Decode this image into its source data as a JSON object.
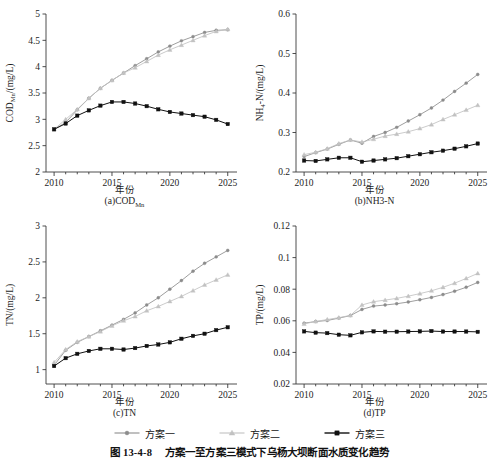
{
  "figure": {
    "caption_number": "图 13-4-8",
    "caption_text": "方案一至方案三模式下乌杨大坝断面水质变化趋势",
    "xaxis_name": "年份"
  },
  "legend": {
    "position": "bottom-center",
    "items": [
      {
        "label": "方案一",
        "marker": "circle",
        "color": "#8c8c8c",
        "line_color": "#8c8c8c"
      },
      {
        "label": "方案二",
        "marker": "triangle",
        "color": "#c2c2c2",
        "line_color": "#c2c2c2"
      },
      {
        "label": "方案三",
        "marker": "square",
        "color": "#111111",
        "line_color": "#111111"
      }
    ]
  },
  "chart_data": [
    {
      "id": "a",
      "type": "line",
      "title": "",
      "panel_caption": "(a)COD",
      "panel_caption_sub": "Mn",
      "ylabel": "COD",
      "ylabel_sub": "Mn",
      "ylabel_unit": "/(mg/L)",
      "xlabel": "年份",
      "x": [
        2010,
        2011,
        2012,
        2013,
        2014,
        2015,
        2016,
        2017,
        2018,
        2019,
        2020,
        2021,
        2022,
        2023,
        2024,
        2025
      ],
      "xlim": [
        2009.3,
        2025.8
      ],
      "ylim": [
        2,
        5
      ],
      "yticks": [
        2,
        2.5,
        3,
        3.5,
        4,
        4.5,
        5
      ],
      "ytick_labels": [
        "2",
        "2.5",
        "3",
        "3.5",
        "4",
        "4.5",
        "5"
      ],
      "xticks": [
        2010,
        2015,
        2020,
        2025
      ],
      "xtick_labels": [
        "2010",
        "2015",
        "2020",
        "2025"
      ],
      "grid": false,
      "series": [
        {
          "name": "方案一",
          "marker": "circle",
          "color": "#8c8c8c",
          "values": [
            2.81,
            2.94,
            3.18,
            3.4,
            3.59,
            3.74,
            3.88,
            4.02,
            4.15,
            4.28,
            4.39,
            4.49,
            4.57,
            4.65,
            4.69,
            4.7
          ]
        },
        {
          "name": "方案二",
          "marker": "triangle",
          "color": "#c2c2c2",
          "values": [
            2.81,
            3.0,
            3.19,
            3.4,
            3.59,
            3.74,
            3.88,
            3.98,
            4.1,
            4.22,
            4.32,
            4.41,
            4.5,
            4.59,
            4.67,
            4.71
          ]
        },
        {
          "name": "方案三",
          "marker": "square",
          "color": "#111111",
          "values": [
            2.81,
            2.92,
            3.07,
            3.17,
            3.26,
            3.33,
            3.33,
            3.3,
            3.25,
            3.19,
            3.14,
            3.11,
            3.08,
            3.05,
            2.99,
            2.91
          ]
        }
      ]
    },
    {
      "id": "b",
      "type": "line",
      "title": "",
      "panel_caption": "(b)NH3-N",
      "panel_caption_sub": "",
      "ylabel": "NH",
      "ylabel_sub": "4",
      "ylabel_unit": "-N/(mg/L)",
      "xlabel": "年份",
      "x": [
        2010,
        2011,
        2012,
        2013,
        2014,
        2015,
        2016,
        2017,
        2018,
        2019,
        2020,
        2021,
        2022,
        2023,
        2024,
        2025
      ],
      "xlim": [
        2009.3,
        2025.8
      ],
      "ylim": [
        0.2,
        0.6
      ],
      "yticks": [
        0.2,
        0.3,
        0.4,
        0.5,
        0.6
      ],
      "ytick_labels": [
        "0.2",
        "0.3",
        "0.4",
        "0.5",
        "0.6"
      ],
      "xticks": [
        2010,
        2015,
        2020,
        2025
      ],
      "xtick_labels": [
        "2010",
        "2015",
        "2020",
        "2025"
      ],
      "grid": false,
      "series": [
        {
          "name": "方案一",
          "marker": "circle",
          "color": "#8c8c8c",
          "values": [
            0.239,
            0.249,
            0.258,
            0.27,
            0.281,
            0.273,
            0.29,
            0.3,
            0.313,
            0.329,
            0.345,
            0.362,
            0.382,
            0.404,
            0.425,
            0.447
          ]
        },
        {
          "name": "方案二",
          "marker": "triangle",
          "color": "#c2c2c2",
          "values": [
            0.244,
            0.25,
            0.259,
            0.272,
            0.281,
            0.276,
            0.283,
            0.291,
            0.296,
            0.302,
            0.31,
            0.32,
            0.333,
            0.345,
            0.357,
            0.369
          ]
        },
        {
          "name": "方案三",
          "marker": "square",
          "color": "#111111",
          "values": [
            0.229,
            0.228,
            0.232,
            0.236,
            0.236,
            0.226,
            0.229,
            0.232,
            0.235,
            0.24,
            0.245,
            0.25,
            0.254,
            0.259,
            0.265,
            0.272
          ]
        }
      ]
    },
    {
      "id": "c",
      "type": "line",
      "title": "",
      "panel_caption": "(c)TN",
      "panel_caption_sub": "",
      "ylabel": "TN",
      "ylabel_sub": "",
      "ylabel_unit": "/(mg/L)",
      "xlabel": "年份",
      "x": [
        2010,
        2011,
        2012,
        2013,
        2014,
        2015,
        2016,
        2017,
        2018,
        2019,
        2020,
        2021,
        2022,
        2023,
        2024,
        2025
      ],
      "xlim": [
        2009.3,
        2025.8
      ],
      "ylim": [
        0.8,
        3.0
      ],
      "yticks": [
        1,
        1.5,
        2,
        2.5,
        3
      ],
      "ytick_labels": [
        "1",
        "1.5",
        "2",
        "2.5",
        "3"
      ],
      "xticks": [
        2010,
        2015,
        2020,
        2025
      ],
      "xtick_labels": [
        "2010",
        "2015",
        "2020",
        "2025"
      ],
      "grid": false,
      "series": [
        {
          "name": "方案一",
          "marker": "circle",
          "color": "#8c8c8c",
          "values": [
            1.06,
            1.27,
            1.38,
            1.46,
            1.54,
            1.62,
            1.7,
            1.79,
            1.9,
            2.0,
            2.12,
            2.24,
            2.37,
            2.48,
            2.57,
            2.66
          ]
        },
        {
          "name": "方案二",
          "marker": "triangle",
          "color": "#c2c2c2",
          "values": [
            1.1,
            1.28,
            1.39,
            1.46,
            1.53,
            1.61,
            1.68,
            1.74,
            1.82,
            1.88,
            1.95,
            2.02,
            2.1,
            2.18,
            2.25,
            2.32
          ]
        },
        {
          "name": "方案三",
          "marker": "square",
          "color": "#111111",
          "values": [
            1.05,
            1.16,
            1.22,
            1.26,
            1.29,
            1.29,
            1.28,
            1.3,
            1.33,
            1.35,
            1.38,
            1.43,
            1.47,
            1.5,
            1.55,
            1.59
          ]
        }
      ]
    },
    {
      "id": "d",
      "type": "line",
      "title": "",
      "panel_caption": "(d)TP",
      "panel_caption_sub": "",
      "ylabel": "TP",
      "ylabel_sub": "",
      "ylabel_unit": "/(mg/L)",
      "xlabel": "年份",
      "x": [
        2010,
        2011,
        2012,
        2013,
        2014,
        2015,
        2016,
        2017,
        2018,
        2019,
        2020,
        2021,
        2022,
        2023,
        2024,
        2025
      ],
      "xlim": [
        2009.3,
        2025.8
      ],
      "ylim": [
        0.02,
        0.12
      ],
      "yticks": [
        0.02,
        0.04,
        0.06,
        0.08,
        0.1,
        0.12
      ],
      "ytick_labels": [
        "0.02",
        "0.04",
        "0.06",
        "0.08",
        "0.1",
        "0.12"
      ],
      "xticks": [
        2010,
        2015,
        2020,
        2025
      ],
      "xtick_labels": [
        "2010",
        "2015",
        "2020",
        "2025"
      ],
      "grid": false,
      "series": [
        {
          "name": "方案一",
          "marker": "circle",
          "color": "#8c8c8c",
          "values": [
            0.0585,
            0.0595,
            0.0602,
            0.0617,
            0.0633,
            0.0672,
            0.0693,
            0.07,
            0.0708,
            0.0719,
            0.0733,
            0.0748,
            0.0766,
            0.0787,
            0.0812,
            0.0843
          ]
        },
        {
          "name": "方案二",
          "marker": "triangle",
          "color": "#c2c2c2",
          "values": [
            0.058,
            0.0596,
            0.0608,
            0.062,
            0.0634,
            0.07,
            0.0721,
            0.0731,
            0.0742,
            0.0756,
            0.0772,
            0.079,
            0.0812,
            0.0838,
            0.0868,
            0.09
          ]
        },
        {
          "name": "方案三",
          "marker": "square",
          "color": "#111111",
          "values": [
            0.0533,
            0.0525,
            0.0522,
            0.0512,
            0.0508,
            0.0527,
            0.0533,
            0.0531,
            0.0531,
            0.0532,
            0.0533,
            0.0535,
            0.0532,
            0.0532,
            0.0532,
            0.053
          ]
        }
      ]
    }
  ]
}
